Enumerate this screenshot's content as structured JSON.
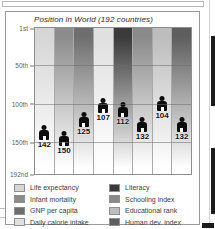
{
  "figure": {
    "title": "Position in World (192 countries)"
  },
  "chart_data": {
    "type": "bar",
    "title": "Position in World (192 countries)",
    "xlabel": "",
    "ylabel": "",
    "ylim": [
      1,
      192
    ],
    "y_inverted": true,
    "grid": true,
    "legend_position": "bottom",
    "tick_labels": [
      "1st",
      "50th",
      "100th",
      "150th",
      "192nd"
    ],
    "tick_values": [
      1,
      50,
      100,
      150,
      192
    ],
    "categories": [
      "Life expectancy",
      "Infant mortality",
      "GNP per capita",
      "Daily calorie intake",
      "Literacy",
      "Schooling index",
      "Educational rank",
      "Human dev. index"
    ],
    "values": [
      142,
      150,
      125,
      107,
      112,
      132,
      104,
      132
    ],
    "colors": [
      "#d6d6d6",
      "#8c8c8c",
      "#6e6e6e",
      "#e0e0e0",
      "#3a3a3a",
      "#8a8a8a",
      "#bdbdbd",
      "#5e5e5e"
    ]
  },
  "legend": {
    "left_column": [
      {
        "label": "Life expectancy",
        "color": "#d6d6d6"
      },
      {
        "label": "Infant mortality",
        "color": "#8c8c8c"
      },
      {
        "label": "GNP per capita",
        "color": "#6e6e6e"
      },
      {
        "label": "Daily calorie intake",
        "color": "#e0e0e0"
      }
    ],
    "right_column": [
      {
        "label": "Literacy",
        "color": "#3a3a3a"
      },
      {
        "label": "Schooling index",
        "color": "#8a8a8a"
      },
      {
        "label": "Educational rank",
        "color": "#bdbdbd"
      },
      {
        "label": "Human dev. index",
        "color": "#5e5e5e"
      }
    ]
  }
}
